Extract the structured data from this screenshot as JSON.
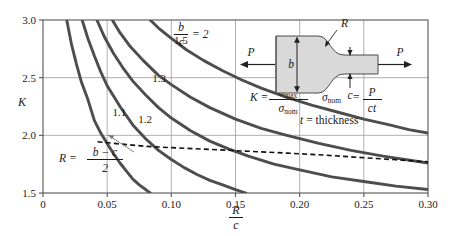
{
  "figure": {
    "name": "stress-concentration-factor-chart",
    "axis_label_y": "K",
    "axis_label_x_num": "R",
    "axis_label_x_den": "c"
  },
  "colors": {
    "curve": "#4d4d4d",
    "grid": "#9a9a9a",
    "frame": "#555555",
    "text": "#1a1a1a",
    "dashed": "#111111",
    "specimen_fill": "#d9d9d9",
    "specimen_edge": "#4a4a4a",
    "leader": "#777777"
  },
  "annotations": {
    "ratio_num": "b",
    "ratio_den": "c",
    "ratio_equals": "= 2",
    "R_definition_lhs": "R =",
    "R_definition_num": "b − c",
    "R_definition_den": "2",
    "K_lhs": "K =",
    "K_num": "σ",
    "K_num_sub": "max",
    "K_den": "σ",
    "K_den_sub": "nom",
    "sigma_nom_lhs": "σ",
    "sigma_nom_lhs_sub": "nom",
    "sigma_nom_eq": "=",
    "sigma_nom_num": "P",
    "sigma_nom_den": "ct",
    "thickness_note_var": "t",
    "thickness_note_rest": "= thickness",
    "specimen_R": "R",
    "specimen_b": "b",
    "specimen_c": "c",
    "specimen_P_left": "P",
    "specimen_P_right": "P"
  },
  "chart_data": {
    "type": "line",
    "xlabel": "R/c",
    "ylabel": "K",
    "xlim": [
      0,
      0.3
    ],
    "ylim": [
      1.5,
      3.0
    ],
    "xticks": [
      0,
      0.05,
      0.1,
      0.15,
      0.2,
      0.25,
      0.3
    ],
    "xtick_labels": [
      "0",
      "0.05",
      "0.10",
      "0.15",
      "0.20",
      "0.25",
      "0.30"
    ],
    "yticks": [
      1.5,
      2.0,
      2.5,
      3.0
    ],
    "ytick_labels": [
      "1.5",
      "2.0",
      "2.5",
      "3.0"
    ],
    "grid": true,
    "legend": "inline-curve-labels",
    "series": [
      {
        "name": "1.1",
        "label": "1.1",
        "label_x": 0.0595,
        "label_y": 2.17,
        "points": [
          [
            0.0185,
            3.0
          ],
          [
            0.022,
            2.8
          ],
          [
            0.026,
            2.62
          ],
          [
            0.03,
            2.46
          ],
          [
            0.035,
            2.31
          ],
          [
            0.04,
            2.13
          ],
          [
            0.045,
            2.02
          ],
          [
            0.05,
            1.93
          ],
          [
            0.055,
            1.84
          ],
          [
            0.06,
            1.76
          ],
          [
            0.065,
            1.69
          ],
          [
            0.07,
            1.62
          ],
          [
            0.075,
            1.57
          ],
          [
            0.08,
            1.53
          ],
          [
            0.0835,
            1.5
          ]
        ]
      },
      {
        "name": "1.2",
        "label": "1.2",
        "label_x": 0.0795,
        "label_y": 2.11,
        "points": [
          [
            0.0305,
            3.0
          ],
          [
            0.035,
            2.84
          ],
          [
            0.04,
            2.69
          ],
          [
            0.045,
            2.55
          ],
          [
            0.05,
            2.43
          ],
          [
            0.06,
            2.25
          ],
          [
            0.07,
            2.09
          ],
          [
            0.08,
            1.97
          ],
          [
            0.09,
            1.87
          ],
          [
            0.1,
            1.79
          ],
          [
            0.11,
            1.72
          ],
          [
            0.12,
            1.66
          ],
          [
            0.13,
            1.61
          ],
          [
            0.14,
            1.57
          ],
          [
            0.15,
            1.53
          ],
          [
            0.158,
            1.5
          ]
        ]
      },
      {
        "name": "1.3",
        "label": "1.3",
        "label_x": 0.0905,
        "label_y": 2.46,
        "points": [
          [
            0.042,
            3.0
          ],
          [
            0.048,
            2.85
          ],
          [
            0.055,
            2.71
          ],
          [
            0.062,
            2.59
          ],
          [
            0.07,
            2.47
          ],
          [
            0.08,
            2.35
          ],
          [
            0.09,
            2.24
          ],
          [
            0.1,
            2.15
          ],
          [
            0.115,
            2.04
          ],
          [
            0.13,
            1.95
          ],
          [
            0.145,
            1.88
          ],
          [
            0.16,
            1.82
          ],
          [
            0.18,
            1.75
          ],
          [
            0.2,
            1.7
          ],
          [
            0.225,
            1.64
          ],
          [
            0.25,
            1.6
          ],
          [
            0.275,
            1.56
          ],
          [
            0.3,
            1.53
          ]
        ]
      },
      {
        "name": "1.5",
        "label": "1.5",
        "label_x": 0.1075,
        "label_y": 2.79,
        "points": [
          [
            0.054,
            3.0
          ],
          [
            0.06,
            2.89
          ],
          [
            0.068,
            2.77
          ],
          [
            0.078,
            2.65
          ],
          [
            0.09,
            2.52
          ],
          [
            0.1,
            2.44
          ],
          [
            0.115,
            2.33
          ],
          [
            0.13,
            2.24
          ],
          [
            0.15,
            2.14
          ],
          [
            0.17,
            2.06
          ],
          [
            0.19,
            2.0
          ],
          [
            0.215,
            1.93
          ],
          [
            0.24,
            1.87
          ],
          [
            0.265,
            1.82
          ],
          [
            0.3,
            1.76
          ]
        ]
      },
      {
        "name": "2",
        "label": "b/c = 2",
        "label_x": 0.142,
        "label_y": 2.84,
        "points": [
          [
            0.0835,
            3.0
          ],
          [
            0.09,
            2.93
          ],
          [
            0.1,
            2.84
          ],
          [
            0.112,
            2.74
          ],
          [
            0.125,
            2.65
          ],
          [
            0.14,
            2.56
          ],
          [
            0.155,
            2.48
          ],
          [
            0.17,
            2.41
          ],
          [
            0.19,
            2.33
          ],
          [
            0.21,
            2.26
          ],
          [
            0.23,
            2.2
          ],
          [
            0.25,
            2.14
          ],
          [
            0.27,
            2.09
          ],
          [
            0.285,
            2.05
          ],
          [
            0.3,
            2.02
          ]
        ]
      }
    ],
    "dashed_reference_line": {
      "name": "R-equals-half-b-minus-c",
      "points": [
        [
          0.0425,
          1.945
        ],
        [
          0.06,
          1.925
        ],
        [
          0.08,
          1.905
        ],
        [
          0.1,
          1.893
        ],
        [
          0.13,
          1.878
        ],
        [
          0.16,
          1.862
        ],
        [
          0.19,
          1.846
        ],
        [
          0.22,
          1.828
        ],
        [
          0.25,
          1.806
        ],
        [
          0.275,
          1.788
        ],
        [
          0.3,
          1.77
        ]
      ]
    }
  }
}
